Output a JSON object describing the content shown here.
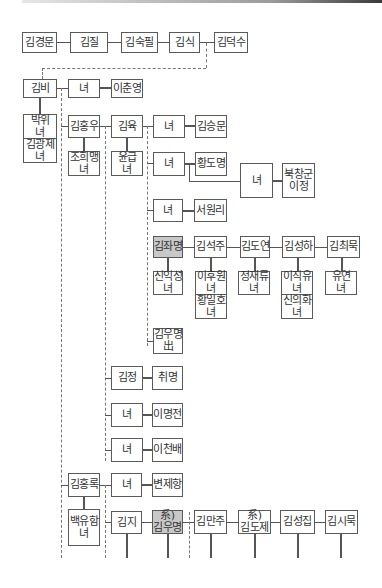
{
  "diagram": {
    "nodes": {
      "n1": {
        "l1": "김경문"
      },
      "n2": {
        "l1": "김질"
      },
      "n3": {
        "l1": "김숙필"
      },
      "n4": {
        "l1": "김식"
      },
      "n5": {
        "l1": "김덕수"
      },
      "n6": {
        "l1": "김비"
      },
      "n7": {
        "l1": "녀"
      },
      "n8": {
        "l1": "이춘영"
      },
      "n9": {
        "l1": "박위",
        "l2": "녀"
      },
      "n10": {
        "l1": "김광제",
        "l2": "녀"
      },
      "n11": {
        "l1": "김홍우"
      },
      "n12": {
        "l1": "김육"
      },
      "n13": {
        "l1": "녀"
      },
      "n14": {
        "l1": "김승문"
      },
      "n15": {
        "l1": "조희맹",
        "l2": "녀"
      },
      "n16": {
        "l1": "윤급",
        "l2": "녀"
      },
      "n17": {
        "l1": "녀"
      },
      "n18": {
        "l1": "황도명"
      },
      "n19": {
        "l1": "녀"
      },
      "n20": {
        "l1": "북창군",
        "l2": "이정"
      },
      "n21": {
        "l1": "녀"
      },
      "n22": {
        "l1": "서원리"
      },
      "n23": {
        "l1": "김좌명"
      },
      "n24": {
        "l1": "김석주"
      },
      "n25": {
        "l1": "김도연"
      },
      "n26": {
        "l1": "김성하"
      },
      "n27": {
        "l1": "김최묵"
      },
      "n28": {
        "l1": "신익성",
        "l2": "녀"
      },
      "n29": {
        "l1": "이후원",
        "l2": "녀"
      },
      "n30": {
        "l1": "황일호",
        "l2": "녀"
      },
      "n31": {
        "l1": "정재류",
        "l2": "녀"
      },
      "n32": {
        "l1": "이직유",
        "l2": "녀"
      },
      "n33": {
        "l1": "신의화",
        "l2": "녀"
      },
      "n34": {
        "l1": "유연",
        "l2": "녀"
      },
      "n35": {
        "l1": "김우명",
        "l2": "出"
      },
      "n36": {
        "l1": "김정"
      },
      "n37": {
        "l1": "취명"
      },
      "n38": {
        "l1": "녀"
      },
      "n39": {
        "l1": "이명전"
      },
      "n40": {
        "l1": "녀"
      },
      "n41": {
        "l1": "이천배"
      },
      "n42": {
        "l1": "김홍록"
      },
      "n43": {
        "l1": "녀"
      },
      "n44": {
        "l1": "변제항"
      },
      "n45": {
        "l1": "백유함",
        "l2": "녀"
      },
      "n46": {
        "l1": "김지"
      },
      "n47": {
        "l1": "系)",
        "l2": "김우명"
      },
      "n48": {
        "l1": "김만주"
      },
      "n49": {
        "l1": "系)",
        "l2": "김도제"
      },
      "n50": {
        "l1": "김성집"
      },
      "n51": {
        "l1": "김시묵"
      }
    },
    "colors": {
      "border": "#5a5a5a",
      "highlight": "#c8c8c8",
      "line": "#555555"
    }
  }
}
